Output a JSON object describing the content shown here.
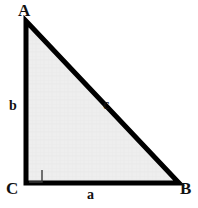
{
  "diagram": {
    "type": "right-triangle",
    "canvas": {
      "width": 198,
      "height": 208,
      "background": "#ffffff"
    },
    "style": {
      "stroke_color": "#000000",
      "stroke_width": 5,
      "fill_color": "#eeeeee",
      "right_angle_stroke": "#333333",
      "label_color": "#111111"
    },
    "vertices": [
      {
        "name": "A",
        "label": "A",
        "x": 26,
        "y": 21,
        "position": "top-left"
      },
      {
        "name": "B",
        "label": "B",
        "x": 179,
        "y": 183,
        "position": "bottom-right"
      },
      {
        "name": "C",
        "label": "C",
        "x": 26,
        "y": 183,
        "position": "bottom-left"
      }
    ],
    "sides": [
      {
        "name": "a",
        "label": "a",
        "between": "C-B",
        "role": "base-leg"
      },
      {
        "name": "b",
        "label": "b",
        "between": "A-C",
        "role": "vertical-leg"
      },
      {
        "name": "c",
        "label": "c",
        "between": "A-B",
        "role": "hypotenuse"
      }
    ],
    "right_angle": {
      "at_vertex": "C",
      "marker": "square",
      "size": 12,
      "x": 29,
      "y": 169
    }
  }
}
